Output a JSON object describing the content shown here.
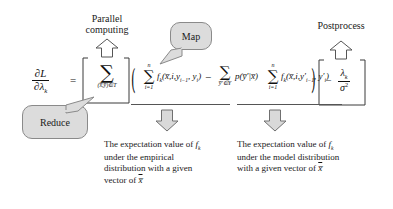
{
  "figure": {
    "background_color": "#ffffff",
    "bubble_fill": "#dcdcdc",
    "bubble_stroke": "#8a8a8a",
    "arrow_fill": "#d9d9d9",
    "arrow_stroke": "#707070",
    "text_color": "#1a1a1a"
  },
  "labels": {
    "parallel_computing_line1": "Parallel",
    "parallel_computing_line2": "computing",
    "postprocess": "Postprocess"
  },
  "bubbles": {
    "map": "Map",
    "reduce": "Reduce"
  },
  "equation": {
    "lhs_numerator": "∂L",
    "lhs_denominator": "∂λ",
    "lhs_denominator_sub": "k",
    "equals": "=",
    "outer_sum_symbol": "∑",
    "outer_sum_limit": "(x̅,y̅)∈T",
    "open_paren": "(",
    "close_paren": ")",
    "empirical_sum_symbol": "∑",
    "empirical_sum_top": "n",
    "empirical_sum_bottom": "i=1",
    "empirical_term": "f",
    "empirical_term_sub": "k",
    "empirical_args": "(x̅,i,y",
    "empirical_args_sub": "i−1",
    "empirical_args_mid": ", y",
    "empirical_args_sub2": "i",
    "empirical_args_close": ")",
    "minus": "−",
    "model_sum_symbol": "∑",
    "model_sum_limit": "y̅′∈Y",
    "prob": "p",
    "prob_args": "(y̅′|x̅)",
    "model_inner_sum_symbol": "∑",
    "model_inner_sum_top": "n",
    "model_inner_sum_bottom": "i=1",
    "model_term": "f",
    "model_term_sub": "k",
    "model_args": "(x̅,i,y′",
    "model_args_sub": "i−1",
    "model_args_mid": ", y′",
    "model_args_sub2": "i",
    "model_args_close": ")",
    "reg_minus": "−",
    "reg_numerator": "λ",
    "reg_numerator_sub": "k",
    "reg_denominator": "σ",
    "reg_denominator_sup": "2"
  },
  "captions": {
    "left": {
      "line1_a": "The expectation value of ",
      "line1_f": "f",
      "line1_sub": "k",
      "line2": "under the empirical",
      "line3": "distribution with a given",
      "line4_a": "vector of ",
      "line4_var": "x̅"
    },
    "right": {
      "line1_a": "The expectation value of ",
      "line1_f": "f",
      "line1_sub": "k",
      "line2": "under the model distribution",
      "line3_a": "with a given vector of ",
      "line3_var": "x̅"
    }
  },
  "arrows": {
    "parallel_computing_arrow": "up-arrow",
    "postprocess_arrow": "up-arrow",
    "left_caption_arrow": "down-arrow",
    "right_caption_arrow": "down-arrow"
  }
}
